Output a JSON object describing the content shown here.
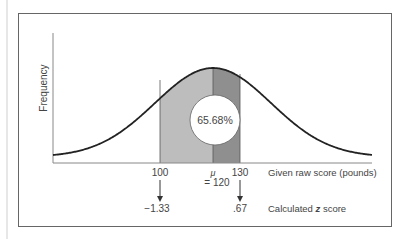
{
  "chart_data": {
    "type": "area",
    "title": "",
    "xlabel": "Given raw score (pounds)",
    "ylabel": "Frequency",
    "distribution": "normal",
    "mean": 120,
    "shaded_region": {
      "from": 100,
      "to": 130,
      "percent": "65.68%"
    },
    "x_ticks": [
      {
        "raw": "100",
        "z": "−1.33"
      },
      {
        "raw": "μ",
        "sub": "= 120"
      },
      {
        "raw": "130",
        "z": ".67"
      }
    ],
    "z_label_prefix": "Calculated ",
    "z_label_var": "z",
    "z_label_suffix": " score",
    "colors": {
      "light_shade": "#bdbdbd",
      "dark_shade": "#8f8f8f",
      "curve": "#222222"
    }
  },
  "labels": {
    "y_axis": "Frequency",
    "percent": "65.68%",
    "tick_100": "100",
    "tick_mu": "μ",
    "tick_mu_eq": "= 120",
    "tick_130": "130",
    "z_100": "−1.33",
    "z_130": ".67",
    "raw_axis_label": "Given raw score (pounds)",
    "z_axis_prefix": "Calculated ",
    "z_axis_var": "z",
    "z_axis_suffix": " score"
  }
}
